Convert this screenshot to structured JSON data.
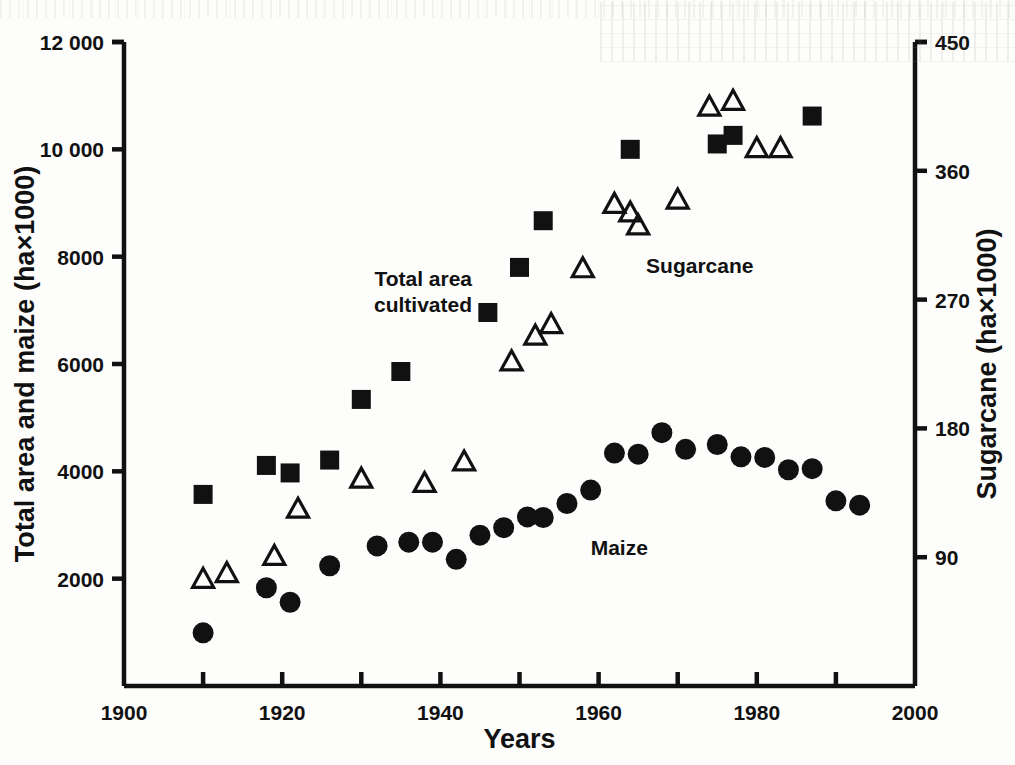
{
  "chart_data": {
    "type": "scatter",
    "title": "",
    "xlabel": "Years",
    "ylabel": "Total area and maize (ha×1000)",
    "y2label": "Sugarcane (ha×1000)",
    "xlim": [
      1900,
      2000
    ],
    "ylim": [
      0,
      12000
    ],
    "y2lim": [
      0,
      450
    ],
    "grid": false,
    "legend_position": "inline-annotations",
    "xticks": [
      1900,
      1920,
      1940,
      1960,
      1980,
      2000
    ],
    "xticklabels": [
      "1900",
      "1920",
      "1940",
      "1960",
      "1980",
      "2000"
    ],
    "xminorticks": [
      1910,
      1930,
      1950,
      1970,
      1990
    ],
    "yticks": [
      2000,
      4000,
      6000,
      8000,
      10000,
      12000
    ],
    "yticklabels": [
      "2000",
      "4000",
      "6000",
      "8000",
      "10 000",
      "12 000"
    ],
    "y2ticks": [
      90,
      180,
      270,
      360,
      450
    ],
    "y2ticklabels": [
      "90",
      "180",
      "270",
      "360",
      "450"
    ],
    "annotations": [
      {
        "text": "Total area cultivated",
        "x": 1944,
        "y": 7450,
        "align": "end",
        "lines": [
          "Total area",
          "cultivated"
        ]
      },
      {
        "text": "Sugarcane",
        "x": 1966,
        "y": 7700,
        "align": "start",
        "lines": [
          "Sugarcane"
        ]
      },
      {
        "text": "Maize",
        "x": 1959,
        "y": 2450,
        "align": "start",
        "lines": [
          "Maize"
        ]
      }
    ],
    "series": [
      {
        "name": "Total area cultivated",
        "marker": "square",
        "axis": "left",
        "unit": "ha×1000",
        "points": [
          {
            "x": 1910,
            "y": 3570
          },
          {
            "x": 1918,
            "y": 4110
          },
          {
            "x": 1921,
            "y": 3970
          },
          {
            "x": 1926,
            "y": 4210
          },
          {
            "x": 1930,
            "y": 5340
          },
          {
            "x": 1935,
            "y": 5860
          },
          {
            "x": 1946,
            "y": 6960
          },
          {
            "x": 1950,
            "y": 7800
          },
          {
            "x": 1953,
            "y": 8670
          },
          {
            "x": 1964,
            "y": 10000
          },
          {
            "x": 1975,
            "y": 10100
          },
          {
            "x": 1977,
            "y": 10260
          },
          {
            "x": 1987,
            "y": 10620
          }
        ]
      },
      {
        "name": "Maize",
        "marker": "circle",
        "axis": "left",
        "unit": "ha×1000",
        "points": [
          {
            "x": 1910,
            "y": 990
          },
          {
            "x": 1918,
            "y": 1830
          },
          {
            "x": 1921,
            "y": 1560
          },
          {
            "x": 1926,
            "y": 2240
          },
          {
            "x": 1932,
            "y": 2610
          },
          {
            "x": 1936,
            "y": 2680
          },
          {
            "x": 1939,
            "y": 2680
          },
          {
            "x": 1942,
            "y": 2360
          },
          {
            "x": 1945,
            "y": 2810
          },
          {
            "x": 1948,
            "y": 2950
          },
          {
            "x": 1951,
            "y": 3150
          },
          {
            "x": 1953,
            "y": 3140
          },
          {
            "x": 1956,
            "y": 3400
          },
          {
            "x": 1959,
            "y": 3650
          },
          {
            "x": 1962,
            "y": 4340
          },
          {
            "x": 1965,
            "y": 4320
          },
          {
            "x": 1968,
            "y": 4720
          },
          {
            "x": 1971,
            "y": 4410
          },
          {
            "x": 1975,
            "y": 4500
          },
          {
            "x": 1978,
            "y": 4270
          },
          {
            "x": 1981,
            "y": 4260
          },
          {
            "x": 1984,
            "y": 4030
          },
          {
            "x": 1987,
            "y": 4050
          },
          {
            "x": 1990,
            "y": 3450
          },
          {
            "x": 1993,
            "y": 3370
          }
        ]
      },
      {
        "name": "Sugarcane",
        "marker": "triangle",
        "axis": "right",
        "unit": "ha×1000",
        "points": [
          {
            "x": 1910,
            "y": 74
          },
          {
            "x": 1913,
            "y": 78
          },
          {
            "x": 1919,
            "y": 90
          },
          {
            "x": 1922,
            "y": 123
          },
          {
            "x": 1930,
            "y": 144
          },
          {
            "x": 1938,
            "y": 141
          },
          {
            "x": 1943,
            "y": 156
          },
          {
            "x": 1949,
            "y": 226
          },
          {
            "x": 1952,
            "y": 244
          },
          {
            "x": 1954,
            "y": 252
          },
          {
            "x": 1958,
            "y": 291
          },
          {
            "x": 1962,
            "y": 336
          },
          {
            "x": 1964,
            "y": 330
          },
          {
            "x": 1965,
            "y": 321
          },
          {
            "x": 1970,
            "y": 339
          },
          {
            "x": 1974,
            "y": 404
          },
          {
            "x": 1977,
            "y": 408
          },
          {
            "x": 1980,
            "y": 375
          },
          {
            "x": 1983,
            "y": 375
          }
        ]
      }
    ]
  },
  "figure": {
    "markers": {
      "square_label": "Total area cultivated",
      "circle_label": "Maize",
      "triangle_label": "Sugarcane"
    }
  }
}
